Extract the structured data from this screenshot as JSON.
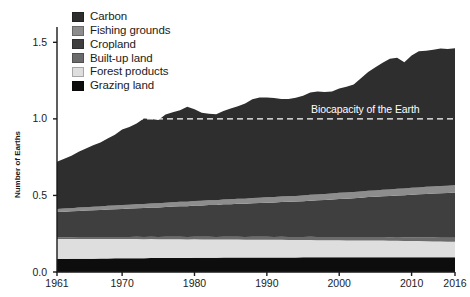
{
  "chart_data": {
    "type": "area",
    "title": "",
    "subtitle": "",
    "xlabel": "",
    "ylabel": "Number of Earths",
    "xlim": [
      1961,
      2016
    ],
    "ylim": [
      0.0,
      1.6
    ],
    "yticks": [
      "0.0",
      "0.5",
      "1.0",
      "1.5"
    ],
    "ytick_values": [
      0.0,
      0.5,
      1.0,
      1.5
    ],
    "xticks": [
      "1961",
      "1970",
      "1980",
      "1990",
      "2000",
      "2010",
      "2016"
    ],
    "xtick_values": [
      1961,
      1970,
      1980,
      1990,
      2000,
      2010,
      2016
    ],
    "grid": false,
    "stacked": true,
    "legend_position": "top-left",
    "legend": [
      {
        "label": "Carbon",
        "color": "#2e2e2e"
      },
      {
        "label": "Fishing grounds",
        "color": "#8d8d8d"
      },
      {
        "label": "Cropland",
        "color": "#3f3f3f"
      },
      {
        "label": "Built-up land",
        "color": "#6b6b6b"
      },
      {
        "label": "Forest products",
        "color": "#dedede"
      },
      {
        "label": "Grazing land",
        "color": "#0d0d0d"
      }
    ],
    "annotations": [
      {
        "text": "Biocapacity of the Earth",
        "y": 1.0,
        "style": "dashed-line",
        "color": "#ffffff"
      }
    ],
    "x": [
      1961,
      1962,
      1963,
      1964,
      1965,
      1966,
      1967,
      1968,
      1969,
      1970,
      1971,
      1972,
      1973,
      1974,
      1975,
      1976,
      1977,
      1978,
      1979,
      1980,
      1981,
      1982,
      1983,
      1984,
      1985,
      1986,
      1987,
      1988,
      1989,
      1990,
      1991,
      1992,
      1993,
      1994,
      1995,
      1996,
      1997,
      1998,
      1999,
      2000,
      2001,
      2002,
      2003,
      2004,
      2005,
      2006,
      2007,
      2008,
      2009,
      2010,
      2011,
      2012,
      2013,
      2014,
      2015,
      2016
    ],
    "series": [
      {
        "name": "Grazing land",
        "color": "#0d0d0d",
        "values": [
          0.085,
          0.085,
          0.086,
          0.086,
          0.087,
          0.087,
          0.088,
          0.088,
          0.089,
          0.089,
          0.09,
          0.09,
          0.09,
          0.091,
          0.091,
          0.091,
          0.092,
          0.092,
          0.092,
          0.093,
          0.093,
          0.093,
          0.093,
          0.094,
          0.094,
          0.094,
          0.094,
          0.094,
          0.095,
          0.095,
          0.095,
          0.095,
          0.095,
          0.095,
          0.096,
          0.096,
          0.096,
          0.096,
          0.096,
          0.096,
          0.096,
          0.096,
          0.097,
          0.097,
          0.097,
          0.097,
          0.097,
          0.097,
          0.097,
          0.097,
          0.097,
          0.097,
          0.097,
          0.097,
          0.097,
          0.097
        ]
      },
      {
        "name": "Forest products",
        "color": "#dedede",
        "values": [
          0.13,
          0.13,
          0.129,
          0.129,
          0.128,
          0.128,
          0.127,
          0.127,
          0.126,
          0.126,
          0.125,
          0.125,
          0.124,
          0.124,
          0.123,
          0.123,
          0.122,
          0.122,
          0.121,
          0.121,
          0.12,
          0.12,
          0.119,
          0.119,
          0.118,
          0.118,
          0.117,
          0.117,
          0.116,
          0.116,
          0.115,
          0.115,
          0.114,
          0.114,
          0.113,
          0.113,
          0.112,
          0.112,
          0.111,
          0.111,
          0.11,
          0.11,
          0.109,
          0.109,
          0.108,
          0.108,
          0.107,
          0.107,
          0.106,
          0.106,
          0.105,
          0.104,
          0.103,
          0.102,
          0.101,
          0.1
        ]
      },
      {
        "name": "Built-up land",
        "color": "#6b6b6b",
        "values": [
          0.012,
          0.012,
          0.012,
          0.013,
          0.013,
          0.013,
          0.013,
          0.014,
          0.014,
          0.014,
          0.014,
          0.015,
          0.015,
          0.015,
          0.015,
          0.016,
          0.016,
          0.016,
          0.016,
          0.017,
          0.017,
          0.017,
          0.017,
          0.018,
          0.018,
          0.018,
          0.018,
          0.019,
          0.019,
          0.019,
          0.019,
          0.02,
          0.02,
          0.02,
          0.02,
          0.021,
          0.021,
          0.021,
          0.021,
          0.022,
          0.022,
          0.022,
          0.022,
          0.023,
          0.023,
          0.023,
          0.023,
          0.024,
          0.024,
          0.024,
          0.024,
          0.025,
          0.025,
          0.025,
          0.025,
          0.026
        ]
      },
      {
        "name": "Cropland",
        "color": "#3f3f3f",
        "values": [
          0.165,
          0.167,
          0.169,
          0.171,
          0.173,
          0.175,
          0.177,
          0.179,
          0.181,
          0.183,
          0.185,
          0.187,
          0.189,
          0.191,
          0.193,
          0.195,
          0.197,
          0.199,
          0.201,
          0.203,
          0.205,
          0.207,
          0.209,
          0.211,
          0.213,
          0.215,
          0.217,
          0.219,
          0.221,
          0.223,
          0.225,
          0.227,
          0.229,
          0.231,
          0.233,
          0.236,
          0.239,
          0.242,
          0.245,
          0.248,
          0.251,
          0.254,
          0.257,
          0.26,
          0.263,
          0.266,
          0.269,
          0.272,
          0.275,
          0.278,
          0.281,
          0.284,
          0.287,
          0.29,
          0.293,
          0.296
        ]
      },
      {
        "name": "Fishing grounds",
        "color": "#8d8d8d",
        "values": [
          0.02,
          0.021,
          0.021,
          0.022,
          0.022,
          0.023,
          0.023,
          0.024,
          0.024,
          0.025,
          0.025,
          0.026,
          0.026,
          0.027,
          0.027,
          0.028,
          0.028,
          0.029,
          0.029,
          0.03,
          0.03,
          0.031,
          0.031,
          0.032,
          0.032,
          0.033,
          0.033,
          0.034,
          0.034,
          0.035,
          0.035,
          0.036,
          0.036,
          0.037,
          0.037,
          0.038,
          0.038,
          0.039,
          0.039,
          0.04,
          0.04,
          0.041,
          0.041,
          0.042,
          0.042,
          0.043,
          0.043,
          0.044,
          0.044,
          0.045,
          0.045,
          0.046,
          0.046,
          0.047,
          0.047,
          0.048
        ]
      },
      {
        "name": "Carbon",
        "color": "#2e2e2e",
        "values": [
          0.308,
          0.325,
          0.343,
          0.365,
          0.383,
          0.402,
          0.418,
          0.44,
          0.463,
          0.493,
          0.508,
          0.527,
          0.558,
          0.551,
          0.543,
          0.575,
          0.589,
          0.599,
          0.62,
          0.599,
          0.575,
          0.565,
          0.561,
          0.578,
          0.592,
          0.604,
          0.621,
          0.645,
          0.654,
          0.651,
          0.648,
          0.637,
          0.636,
          0.641,
          0.652,
          0.668,
          0.673,
          0.666,
          0.667,
          0.681,
          0.691,
          0.702,
          0.739,
          0.775,
          0.804,
          0.829,
          0.854,
          0.855,
          0.823,
          0.864,
          0.889,
          0.889,
          0.894,
          0.898,
          0.893,
          0.894
        ]
      }
    ],
    "total_top": [
      0.72,
      0.74,
      0.76,
      0.786,
      0.806,
      0.828,
      0.846,
      0.872,
      0.897,
      0.93,
      0.947,
      0.97,
      1.002,
      0.999,
      0.992,
      1.028,
      1.044,
      1.057,
      1.08,
      1.063,
      1.04,
      1.033,
      1.03,
      1.052,
      1.067,
      1.082,
      1.1,
      1.128,
      1.139,
      1.139,
      1.137,
      1.13,
      1.13,
      1.138,
      1.151,
      1.172,
      1.179,
      1.176,
      1.179,
      1.198,
      1.21,
      1.225,
      1.265,
      1.306,
      1.337,
      1.366,
      1.393,
      1.399,
      1.369,
      1.414,
      1.441,
      1.445,
      1.452,
      1.459,
      1.456,
      1.461
    ]
  },
  "axis": {
    "ylabel": "Number of Earths",
    "yticks": [
      "0.0",
      "0.5",
      "1.0",
      "1.5"
    ],
    "xticks": [
      "1961",
      "1970",
      "1980",
      "1990",
      "2000",
      "2010",
      "2016"
    ]
  },
  "annotation": {
    "biocapacity": "Biocapacity of the Earth"
  }
}
